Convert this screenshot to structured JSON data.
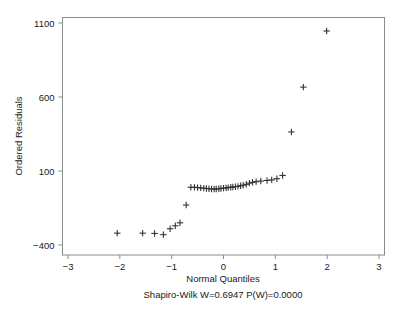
{
  "chart_data": {
    "type": "scatter",
    "title": "",
    "xlabel": "Normal Quantiles",
    "ylabel": "Ordered Residuals",
    "xlim": [
      -3.2,
      3.12
    ],
    "ylim": [
      -500,
      1155
    ],
    "xticks": [
      -3,
      -2,
      -1,
      0,
      1,
      2,
      3
    ],
    "xtick_labels": [
      "-3",
      "-2",
      "-1",
      "0",
      "1",
      "2",
      "3"
    ],
    "yticks": [
      -400,
      100,
      600,
      1100
    ],
    "ytick_labels": [
      "-400",
      "100",
      "600",
      "1100"
    ],
    "grid": false,
    "legend": false,
    "marker": "plus",
    "marker_color": "#333333",
    "annotation": "Shapiro-Wilk W=0.6947  P(W)=0.0000",
    "stats": {
      "test": "Shapiro-Wilk",
      "W": 0.6947,
      "P(W)": 0.0
    },
    "points": [
      [
        -2.05,
        -320
      ],
      [
        -1.56,
        -320
      ],
      [
        -1.33,
        -322
      ],
      [
        -1.16,
        -330
      ],
      [
        -1.03,
        -290
      ],
      [
        -0.93,
        -270
      ],
      [
        -0.84,
        -250
      ],
      [
        -0.72,
        -130
      ],
      [
        -0.63,
        -10
      ],
      [
        -0.56,
        -10
      ],
      [
        -0.5,
        -12
      ],
      [
        -0.44,
        -14
      ],
      [
        -0.38,
        -16
      ],
      [
        -0.33,
        -18
      ],
      [
        -0.28,
        -20
      ],
      [
        -0.23,
        -22
      ],
      [
        -0.18,
        -22
      ],
      [
        -0.14,
        -22
      ],
      [
        -0.09,
        -20
      ],
      [
        -0.05,
        -18
      ],
      [
        0.0,
        -16
      ],
      [
        0.05,
        -14
      ],
      [
        0.09,
        -12
      ],
      [
        0.14,
        -10
      ],
      [
        0.18,
        -8
      ],
      [
        0.23,
        -6
      ],
      [
        0.28,
        -4
      ],
      [
        0.33,
        0
      ],
      [
        0.38,
        4
      ],
      [
        0.44,
        10
      ],
      [
        0.5,
        18
      ],
      [
        0.56,
        24
      ],
      [
        0.63,
        28
      ],
      [
        0.72,
        32
      ],
      [
        0.84,
        36
      ],
      [
        0.93,
        40
      ],
      [
        1.03,
        48
      ],
      [
        1.14,
        70
      ],
      [
        1.31,
        364
      ],
      [
        1.54,
        667
      ],
      [
        1.99,
        1046
      ]
    ]
  },
  "axes": {
    "x_title": "Normal Quantiles",
    "y_title": "Ordered Residuals"
  },
  "caption": "Shapiro-Wilk W=0.6947  P(W)=0.0000"
}
